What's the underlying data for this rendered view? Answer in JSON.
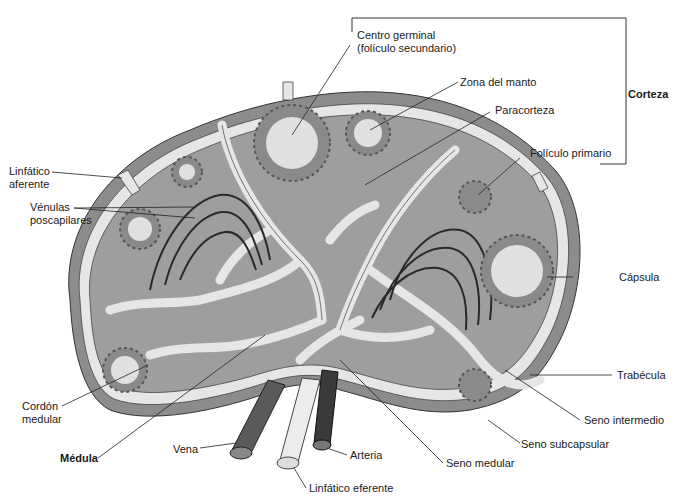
{
  "diagram": {
    "colors": {
      "capsule": "#8c8c8c",
      "parenchyma": "#9e9e9e",
      "sinus": "#e6e6e6",
      "follicle_dots": "#555555",
      "germinal_center": "#e0e0e0",
      "vein": "#5a5a5a",
      "artery": "#3a3a3a",
      "efferent_lymphatic": "#ececec",
      "leader_line": "#222222"
    }
  },
  "labels": {
    "centro_germinal_1": "Centro germinal",
    "centro_germinal_2": "(folículo secundario)",
    "zona_manto": "Zona del manto",
    "corteza": "Corteza",
    "paracorteza": "Paracorteza",
    "foliculo_primario": "Folículo primario",
    "linfatico_aferente_1": "Linfático",
    "linfatico_aferente_2": "aferente",
    "venulas_1": "Vénulas",
    "venulas_2": "poscapilares",
    "capsula": "Cápsula",
    "trabecula": "Trabécula",
    "seno_intermedio": "Seno intermedio",
    "seno_subcapsular": "Seno subcapsular",
    "seno_medular": "Seno medular",
    "cordon_medular_1": "Cordón",
    "cordon_medular_2": "medular",
    "medula": "Médula",
    "vena": "Vena",
    "arteria": "Arteria",
    "linfatico_eferente": "Linfático eferente"
  }
}
